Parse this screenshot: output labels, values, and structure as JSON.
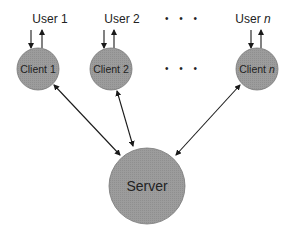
{
  "diagram": {
    "type": "client-server",
    "users": [
      {
        "label": "User 1",
        "prefix": "User",
        "suffix": "1",
        "italic": false
      },
      {
        "label": "User 2",
        "prefix": "User",
        "suffix": "2",
        "italic": false
      },
      {
        "label": "User n",
        "prefix": "User",
        "suffix": "n",
        "italic": true
      }
    ],
    "clients": [
      {
        "label": "Client 1",
        "prefix": "Client",
        "suffix": "1",
        "italic": false
      },
      {
        "label": "Client 2",
        "prefix": "Client",
        "suffix": "2",
        "italic": false
      },
      {
        "label": "Client n",
        "prefix": "Client",
        "suffix": "n",
        "italic": true
      }
    ],
    "ellipsis": "• • •",
    "server": {
      "label": "Server"
    },
    "colors": {
      "node_fill": "#9a9a9a",
      "node_stroke": "#6e6e6e",
      "arrow": "#1a1a1a",
      "text": "#222222"
    }
  }
}
